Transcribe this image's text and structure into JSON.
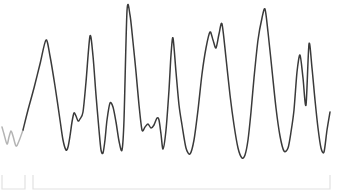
{
  "chart_data": {
    "type": "line",
    "title": "",
    "subtitle": "",
    "xlabel": "",
    "ylabel": "",
    "grid": false,
    "legend": "none",
    "axes_visible": false,
    "xlim": [
      0,
      343
    ],
    "ylim": [
      0,
      165
    ],
    "y_axis_inverted": true,
    "annotations": [],
    "series": [
      {
        "name": "lead-segment",
        "color": "#b4b4b4",
        "style": "solid",
        "width": 1.5,
        "x": [
          2,
          4,
          7,
          9,
          11,
          13,
          16,
          19,
          23
        ],
        "y": [
          127,
          134,
          144,
          137,
          131,
          136,
          146,
          141,
          130
        ]
      },
      {
        "name": "main-trace",
        "color": "#3a3a3a",
        "style": "solid",
        "width": 1.5,
        "x": [
          23,
          28,
          34,
          40,
          46,
          50,
          55,
          60,
          63,
          66,
          68,
          70,
          72,
          74,
          76,
          78,
          80,
          83,
          86,
          90,
          93,
          96,
          99,
          101,
          103,
          105,
          107,
          110,
          113,
          116,
          119,
          122,
          124,
          127,
          130,
          133,
          136,
          139,
          142,
          145,
          148,
          151,
          154,
          157,
          159,
          161,
          163,
          166,
          169,
          171,
          173,
          176,
          179,
          182,
          186,
          190,
          194,
          198,
          202,
          206,
          210,
          213,
          216,
          219,
          222,
          226,
          230,
          234,
          238,
          242,
          245,
          248,
          251,
          254,
          258,
          262,
          265,
          268,
          272,
          276,
          280,
          284,
          288,
          291,
          294,
          297,
          300,
          303,
          306,
          309,
          312,
          315,
          318,
          321,
          324,
          327,
          330
        ],
        "y": [
          130,
          110,
          88,
          64,
          40,
          56,
          86,
          120,
          140,
          150,
          147,
          136,
          122,
          113,
          116,
          121,
          119,
          112,
          82,
          36,
          56,
          95,
          130,
          150,
          153,
          140,
          120,
          103,
          107,
          122,
          141,
          150,
          120,
          11,
          15,
          42,
          72,
          105,
          130,
          127,
          124,
          128,
          125,
          118,
          120,
          134,
          149,
          130,
          90,
          55,
          38,
          72,
          105,
          125,
          148,
          154,
          140,
          110,
          74,
          48,
          32,
          40,
          48,
          34,
          24,
          58,
          95,
          125,
          148,
          158,
          155,
          140,
          112,
          78,
          40,
          18,
          9,
          32,
          70,
          108,
          136,
          151,
          148,
          132,
          110,
          72,
          55,
          78,
          105,
          44,
          68,
          100,
          128,
          148,
          152,
          130,
          112
        ]
      }
    ],
    "axis_bracket": {
      "color": "#e2e2e2",
      "left_bracket": {
        "x_start": 2,
        "x_end": 25,
        "y_baseline": 189,
        "tick_height": 14
      },
      "main_bracket": {
        "x_start": 33,
        "x_end": 330,
        "y_baseline": 189,
        "tick_height": 14
      }
    }
  },
  "chart": {
    "name": "Sparkline waveform"
  }
}
